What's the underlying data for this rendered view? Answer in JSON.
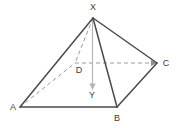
{
  "figure": {
    "name": "square-pyramid-diagram",
    "background_color": "#ffffff",
    "stroke_color": "#4a4a4a",
    "hidden_stroke_color": "#9a9a9a",
    "axis_color": "#b0b0b0",
    "label_color": "#3a3a3a",
    "labels": {
      "apex": "X",
      "base_front_left": "A",
      "base_front_right": "B",
      "base_back_right": "C",
      "base_back_left": "D",
      "height_foot": "Y"
    },
    "points": {
      "X": {
        "x": 93,
        "y": 18
      },
      "A": {
        "x": 20,
        "y": 107
      },
      "B": {
        "x": 117,
        "y": 107
      },
      "C": {
        "x": 157,
        "y": 63
      },
      "D": {
        "x": 75,
        "y": 63
      },
      "Y": {
        "x": 92,
        "y": 88
      }
    },
    "label_positions": {
      "X": {
        "x": 93,
        "y": 8
      },
      "A": {
        "x": 13,
        "y": 108
      },
      "B": {
        "x": 117,
        "y": 119
      },
      "C": {
        "x": 166,
        "y": 64
      },
      "D": {
        "x": 79,
        "y": 71
      },
      "Y": {
        "x": 92,
        "y": 95
      }
    },
    "edges": [
      {
        "id": "edge-XA",
        "from": "X",
        "to": "A",
        "style": "solid"
      },
      {
        "id": "edge-XB",
        "from": "X",
        "to": "B",
        "style": "solid"
      },
      {
        "id": "edge-XC",
        "from": "X",
        "to": "C",
        "style": "solid"
      },
      {
        "id": "edge-XD",
        "from": "X",
        "to": "D",
        "style": "dashed"
      },
      {
        "id": "edge-AB",
        "from": "A",
        "to": "B",
        "style": "solid"
      },
      {
        "id": "edge-BC",
        "from": "B",
        "to": "C",
        "style": "solid"
      },
      {
        "id": "edge-CD",
        "from": "C",
        "to": "D",
        "style": "dashed"
      },
      {
        "id": "edge-DA",
        "from": "D",
        "to": "A",
        "style": "dashed"
      }
    ],
    "height_line": {
      "id": "height-XY",
      "from": "X",
      "to": "Y",
      "style": "solid-arrow"
    }
  }
}
